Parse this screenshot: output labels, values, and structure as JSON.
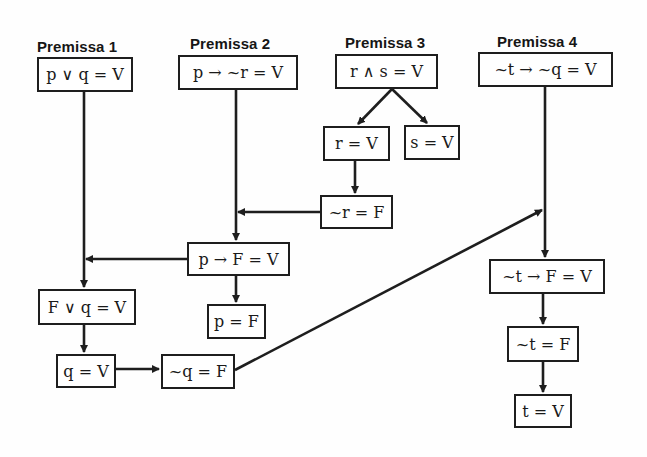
{
  "diagram": {
    "type": "logic-deduction-flowchart",
    "premises": [
      {
        "label": "Premissa 1",
        "expression": "p ∨ q = V"
      },
      {
        "label": "Premissa 2",
        "expression": "p → ~r = V"
      },
      {
        "label": "Premissa 3",
        "expression": "r ∧ s = V"
      },
      {
        "label": "Premissa 4",
        "expression": "~t → ~q = V"
      }
    ],
    "nodes": {
      "p1": "p ∨ q = V",
      "p2": "p → ~r = V",
      "p3": "r ∧ s = V",
      "p4": "~t → ~q = V",
      "r_true": "r = V",
      "s_true": "s = V",
      "not_r_false": "~r = F",
      "p_impl_F": "p → F = V",
      "p_false": "p = F",
      "F_or_q": "F ∨ q = V",
      "q_true": "q = V",
      "not_q_false": "~q = F",
      "not_t_impl_F": "~t → F = V",
      "not_t_false": "~t = F",
      "t_true": "t = V"
    },
    "edges": [
      [
        "p3",
        "r_true"
      ],
      [
        "p3",
        "s_true"
      ],
      [
        "r_true",
        "not_r_false"
      ],
      [
        "not_r_false",
        "p2-line"
      ],
      [
        "p2",
        "p_impl_F"
      ],
      [
        "p_impl_F",
        "p1-line"
      ],
      [
        "p_impl_F",
        "p_false"
      ],
      [
        "p1",
        "F_or_q"
      ],
      [
        "F_or_q",
        "q_true"
      ],
      [
        "q_true",
        "not_q_false"
      ],
      [
        "not_q_false",
        "p4-line"
      ],
      [
        "p4",
        "not_t_impl_F"
      ],
      [
        "not_t_impl_F",
        "not_t_false"
      ],
      [
        "not_t_false",
        "t_true"
      ]
    ],
    "colors": {
      "stroke": "#1e1e1e",
      "background": "#ffffff",
      "text": "#1a1a1a"
    }
  }
}
